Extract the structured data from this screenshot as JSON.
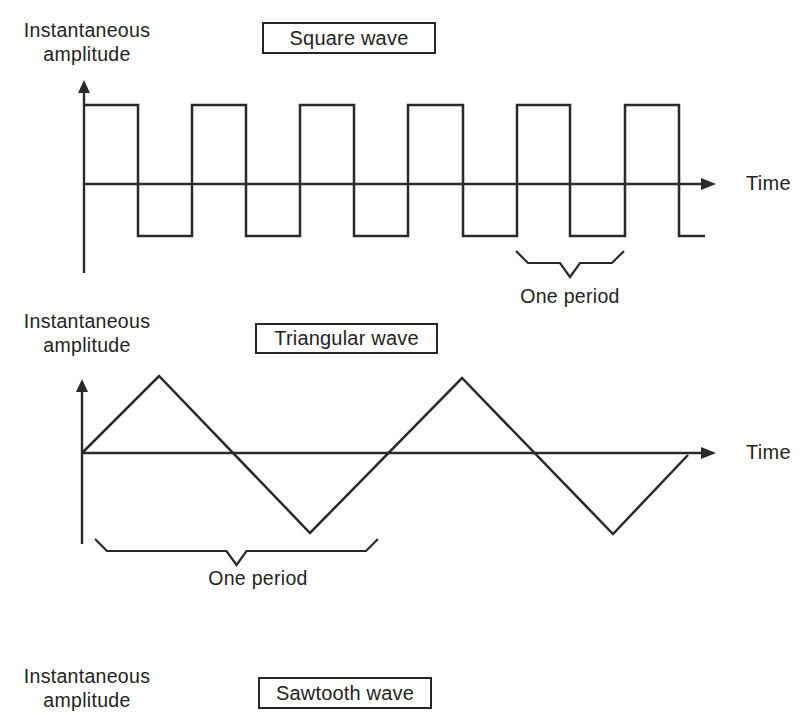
{
  "panels": [
    {
      "id": "square",
      "title": "Square wave",
      "ylabel_line1": "Instantaneous",
      "ylabel_line2": "amplitude",
      "xlabel": "Time",
      "period_label": "One period"
    },
    {
      "id": "triangular",
      "title": "Triangular wave",
      "ylabel_line1": "Instantaneous",
      "ylabel_line2": "amplitude",
      "xlabel": "Time",
      "period_label": "One period"
    },
    {
      "id": "sawtooth",
      "title": "Sawtooth wave",
      "ylabel_line1": "Instantaneous",
      "ylabel_line2": "amplitude"
    }
  ],
  "colors": {
    "line": "#2a2a2a",
    "text": "#232323",
    "background": "#ffffff"
  },
  "geometry": {
    "square": {
      "axis_x": 84,
      "axis_top": 80,
      "axis_bottom": 273,
      "baseline_y": 184,
      "time_arrow_end": 716,
      "high_y": 105,
      "low_y": 236,
      "transitions_x": [
        84,
        138,
        192,
        246,
        300,
        354,
        408,
        463,
        517,
        570,
        625,
        679
      ],
      "end_x": 705,
      "brace": {
        "x1": 516,
        "x2": 624,
        "top_y": 251,
        "flat_y": 263,
        "tip_y": 277
      }
    },
    "triangular": {
      "axis_x": 82,
      "axis_top": 379,
      "axis_bottom": 544,
      "baseline_y": 453,
      "time_arrow_end": 716,
      "points": [
        [
          82,
          453
        ],
        [
          159,
          376
        ],
        [
          310,
          533
        ],
        [
          462,
          378
        ],
        [
          613,
          534
        ],
        [
          688,
          455
        ]
      ],
      "brace": {
        "x1": 95,
        "x2": 378,
        "top_y": 539,
        "flat_y": 551,
        "tip_y": 565
      }
    }
  }
}
